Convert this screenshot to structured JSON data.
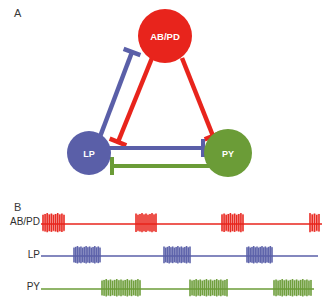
{
  "figure": {
    "panels": [
      {
        "letter": "A",
        "name": "circuit-diagram"
      },
      {
        "letter": "B",
        "name": "spike-traces"
      }
    ]
  },
  "colors": {
    "abpd_red": "#e8241c",
    "lp_blue": "#5a5fa8",
    "py_green": "#6b9c37",
    "label_text": "#2e2e2e",
    "node_text": "#ffffff",
    "background": "#ffffff"
  },
  "panel_a": {
    "letter": "A",
    "nodes": [
      {
        "id": "abpd",
        "label": "AB/PD",
        "cx": 165,
        "cy": 36,
        "r": 27,
        "color": "#e8241c"
      },
      {
        "id": "lp",
        "label": "LP",
        "cx": 89,
        "cy": 153,
        "r": 22,
        "color": "#5a5fa8"
      },
      {
        "id": "py",
        "label": "PY",
        "cx": 228,
        "cy": 153,
        "r": 24,
        "color": "#6b9c37"
      }
    ],
    "connections": [
      {
        "id": "abpd-to-lp",
        "from": "AB/PD",
        "to": "LP",
        "type": "inhibitory-synapse",
        "color": "#e8241c"
      },
      {
        "id": "abpd-to-py",
        "from": "AB/PD",
        "to": "PY",
        "type": "inhibitory-synapse",
        "color": "#e8241c"
      },
      {
        "id": "lp-to-abpd",
        "from": "LP",
        "to": "AB/PD",
        "type": "inhibitory-synapse",
        "color": "#5a5fa8"
      },
      {
        "id": "lp-to-py",
        "from": "LP",
        "to": "PY",
        "type": "inhibitory-synapse",
        "color": "#5a5fa8"
      },
      {
        "id": "py-to-lp",
        "from": "PY",
        "to": "LP",
        "type": "inhibitory-synapse",
        "color": "#6b9c37"
      }
    ]
  },
  "chart_data": {
    "type": "raster",
    "title": "",
    "xlabel": "",
    "ylabel": "",
    "grid": false,
    "legend": "none",
    "xlim": [
      40,
      325
    ],
    "traces": [
      {
        "name": "AB/PD",
        "color": "#e8241c",
        "baseline_y": 224,
        "spike_half_height": 11,
        "line_start": 41,
        "line_end": 322,
        "bursts": [
          {
            "start": 43,
            "end": 64,
            "spikes": 11
          },
          {
            "start": 136,
            "end": 156,
            "spikes": 11
          },
          {
            "start": 222,
            "end": 243,
            "spikes": 11
          },
          {
            "start": 310,
            "end": 319,
            "spikes": 5
          }
        ]
      },
      {
        "name": "LP",
        "color": "#5a5fa8",
        "baseline_y": 256,
        "spike_half_height": 10,
        "line_start": 41,
        "line_end": 318,
        "bursts": [
          {
            "start": 74,
            "end": 100,
            "spikes": 16
          },
          {
            "start": 164,
            "end": 190,
            "spikes": 16
          },
          {
            "start": 247,
            "end": 272,
            "spikes": 16
          }
        ]
      },
      {
        "name": "PY",
        "color": "#6b9c37",
        "baseline_y": 289,
        "spike_half_height": 10,
        "line_start": 41,
        "line_end": 314,
        "bursts": [
          {
            "start": 102,
            "end": 140,
            "spikes": 19
          },
          {
            "start": 190,
            "end": 227,
            "spikes": 19
          },
          {
            "start": 274,
            "end": 311,
            "spikes": 19
          }
        ]
      }
    ]
  },
  "panel_b": {
    "letter": "B",
    "labels": {
      "abpd": "AB/PD",
      "lp": "LP",
      "py": "PY"
    }
  }
}
